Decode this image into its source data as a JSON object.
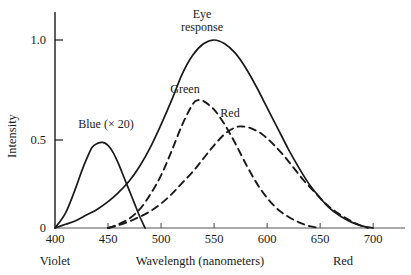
{
  "chart_data": {
    "type": "line",
    "title": "",
    "xlabel": "Wavelength (nanometers)",
    "ylabel": "Intensity",
    "xlim": [
      400,
      730
    ],
    "ylim": [
      0,
      1.12
    ],
    "grid": false,
    "legend_position": "inline-annotations",
    "xticks": [
      400,
      450,
      500,
      550,
      600,
      650,
      700
    ],
    "xtick_labels": [
      "400",
      "450",
      "500",
      "550",
      "600",
      "650",
      "700"
    ],
    "yticks": [
      0,
      0.5,
      1.0
    ],
    "ytick_labels": [
      "0",
      "0.5",
      "1.0"
    ],
    "axis_end_labels": {
      "left": "Violet",
      "right": "Red"
    },
    "annotations": [
      {
        "text": "Eye\nresponse",
        "line1": "Eye",
        "line2": "response",
        "x": 551,
        "y": 1.06
      },
      {
        "text": "Green",
        "x": 529,
        "y": 0.78
      },
      {
        "text": "Red",
        "x": 573,
        "y": 0.64
      },
      {
        "text": "Blue (× 20)",
        "x": 440,
        "y": 0.56
      }
    ],
    "series": [
      {
        "name": "Eye response",
        "style": "solid",
        "color": "#1a1a1a",
        "peak_x": 550,
        "peak_y": 1.0,
        "x": [
          400,
          410,
          420,
          430,
          440,
          450,
          460,
          470,
          480,
          490,
          500,
          510,
          520,
          530,
          540,
          550,
          560,
          570,
          580,
          590,
          600,
          610,
          620,
          630,
          640,
          650,
          660,
          670,
          680,
          690,
          700
        ],
        "values": [
          0.0,
          0.02,
          0.04,
          0.07,
          0.1,
          0.14,
          0.19,
          0.25,
          0.33,
          0.43,
          0.55,
          0.68,
          0.82,
          0.92,
          0.98,
          1.0,
          0.98,
          0.93,
          0.85,
          0.75,
          0.64,
          0.53,
          0.42,
          0.32,
          0.23,
          0.16,
          0.1,
          0.06,
          0.03,
          0.01,
          0.0
        ]
      },
      {
        "name": "Blue (× 20)",
        "style": "solid",
        "color": "#1a1a1a",
        "peak_x": 445,
        "peak_y": 0.45,
        "x": [
          400,
          410,
          420,
          425,
          430,
          435,
          440,
          445,
          450,
          455,
          460,
          465,
          470,
          475,
          480,
          485
        ],
        "values": [
          0.0,
          0.08,
          0.22,
          0.3,
          0.37,
          0.43,
          0.45,
          0.455,
          0.44,
          0.4,
          0.34,
          0.27,
          0.2,
          0.13,
          0.06,
          0.0
        ]
      },
      {
        "name": "Green",
        "style": "dashed",
        "color": "#1a1a1a",
        "peak_x": 535,
        "peak_y": 0.68,
        "x": [
          450,
          460,
          470,
          480,
          490,
          500,
          510,
          520,
          530,
          535,
          540,
          550,
          560,
          570,
          580,
          590,
          600,
          610,
          620,
          630,
          640,
          650
        ],
        "values": [
          0.0,
          0.02,
          0.05,
          0.1,
          0.18,
          0.28,
          0.41,
          0.55,
          0.66,
          0.68,
          0.675,
          0.63,
          0.55,
          0.45,
          0.34,
          0.24,
          0.16,
          0.1,
          0.06,
          0.03,
          0.01,
          0.0
        ]
      },
      {
        "name": "Red",
        "style": "dashed",
        "color": "#1a1a1a",
        "peak_x": 577,
        "peak_y": 0.54,
        "x": [
          450,
          460,
          470,
          480,
          490,
          500,
          510,
          520,
          530,
          540,
          550,
          560,
          570,
          577,
          585,
          595,
          605,
          615,
          625,
          635,
          645,
          655,
          665,
          675,
          685,
          695
        ],
        "values": [
          0.0,
          0.015,
          0.035,
          0.06,
          0.09,
          0.13,
          0.18,
          0.24,
          0.3,
          0.37,
          0.44,
          0.5,
          0.535,
          0.54,
          0.53,
          0.5,
          0.45,
          0.39,
          0.32,
          0.25,
          0.19,
          0.13,
          0.085,
          0.05,
          0.02,
          0.0
        ]
      }
    ]
  }
}
